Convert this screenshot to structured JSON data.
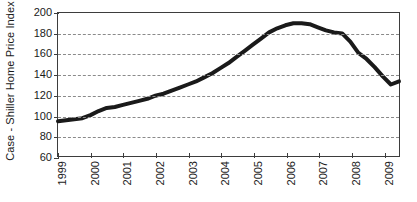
{
  "chart_data": {
    "type": "line",
    "title": "",
    "subtitle": "",
    "xlabel": "",
    "ylabel": "Case - Shiller Home Price Index",
    "xlim": [
      1999,
      2009.5
    ],
    "ylim": [
      60,
      200
    ],
    "ytick_labels": [
      "200",
      "180",
      "160",
      "140",
      "120",
      "100",
      "80",
      "60"
    ],
    "ytick_values": [
      200,
      180,
      160,
      140,
      120,
      100,
      80,
      60
    ],
    "ytick_interval": 20,
    "xtick_labels": [
      "1999",
      "2000",
      "2001",
      "2002",
      "2003",
      "2004",
      "2005",
      "2006",
      "2007",
      "2008",
      "2009"
    ],
    "xtick_values": [
      1999,
      2000,
      2001,
      2002,
      2003,
      2004,
      2005,
      2006,
      2007,
      2008,
      2009
    ],
    "grid": "horizontal-dashed",
    "gridlines_at": [
      180,
      160,
      140,
      120,
      100,
      80
    ],
    "legend": "none",
    "legend_position": "none",
    "annotations": [],
    "series": [
      {
        "name": "Case-Shiller Home Price Index",
        "color": "#1a1a1a",
        "line_width": 4,
        "x": [
          1999.0,
          1999.25,
          1999.5,
          1999.75,
          2000.0,
          2000.25,
          2000.5,
          2000.75,
          2001.0,
          2001.25,
          2001.5,
          2001.75,
          2002.0,
          2002.25,
          2002.5,
          2002.75,
          2003.0,
          2003.25,
          2003.5,
          2003.75,
          2004.0,
          2004.25,
          2004.5,
          2004.75,
          2005.0,
          2005.25,
          2005.5,
          2005.75,
          2006.0,
          2006.25,
          2006.5,
          2006.75,
          2007.0,
          2007.25,
          2007.5,
          2007.75,
          2008.0,
          2008.25,
          2008.5,
          2008.75,
          2009.0,
          2009.25,
          2009.5
        ],
        "values": [
          94,
          95,
          96,
          97,
          100,
          104,
          107,
          108,
          110,
          112,
          114,
          116,
          119,
          121,
          124,
          127,
          130,
          133,
          137,
          141,
          146,
          151,
          157,
          163,
          169,
          175,
          181,
          185,
          188,
          190,
          190,
          189,
          186,
          183,
          181,
          180,
          172,
          161,
          155,
          147,
          138,
          130,
          133
        ]
      }
    ]
  },
  "figure": {
    "background_color": "#ffffff",
    "frame_color": "#3d3d3d",
    "grid_color": "#8a8a8a"
  }
}
